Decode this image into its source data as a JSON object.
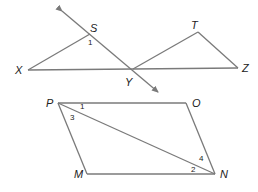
{
  "figure1": {
    "points": {
      "X": {
        "label": "X",
        "x": 28,
        "y": 70
      },
      "S": {
        "label": "S",
        "x": 90,
        "y": 34
      },
      "Y": {
        "label": "Y",
        "x": 133,
        "y": 69
      },
      "T": {
        "label": "T",
        "x": 198,
        "y": 32
      },
      "Z": {
        "label": "Z",
        "x": 238,
        "y": 68
      }
    },
    "segments": [
      [
        "X",
        "S"
      ],
      [
        "X",
        "Z"
      ],
      [
        "Y",
        "T"
      ],
      [
        "T",
        "Z"
      ]
    ],
    "line": {
      "through": [
        "S",
        "Y"
      ],
      "arrow_start": {
        "x": 62,
        "y": 11
      },
      "arrow_end": {
        "x": 158,
        "y": 92
      }
    },
    "angle_labels": [
      {
        "label": "1",
        "x": 88,
        "y": 45
      }
    ]
  },
  "figure2": {
    "points": {
      "P": {
        "label": "P",
        "x": 58,
        "y": 103
      },
      "O": {
        "label": "O",
        "x": 186,
        "y": 103
      },
      "N": {
        "label": "N",
        "x": 215,
        "y": 174
      },
      "M": {
        "label": "M",
        "x": 87,
        "y": 174
      }
    },
    "segments": [
      [
        "P",
        "O"
      ],
      [
        "O",
        "N"
      ],
      [
        "N",
        "M"
      ],
      [
        "M",
        "P"
      ],
      [
        "P",
        "N"
      ]
    ],
    "angle_labels": [
      {
        "label": "1",
        "x": 80,
        "y": 109
      },
      {
        "label": "3",
        "x": 70,
        "y": 120
      },
      {
        "label": "4",
        "x": 199,
        "y": 161
      },
      {
        "label": "2",
        "x": 191,
        "y": 172
      }
    ]
  },
  "colors": {
    "line": "#7a7a7a",
    "text": "#222222"
  }
}
